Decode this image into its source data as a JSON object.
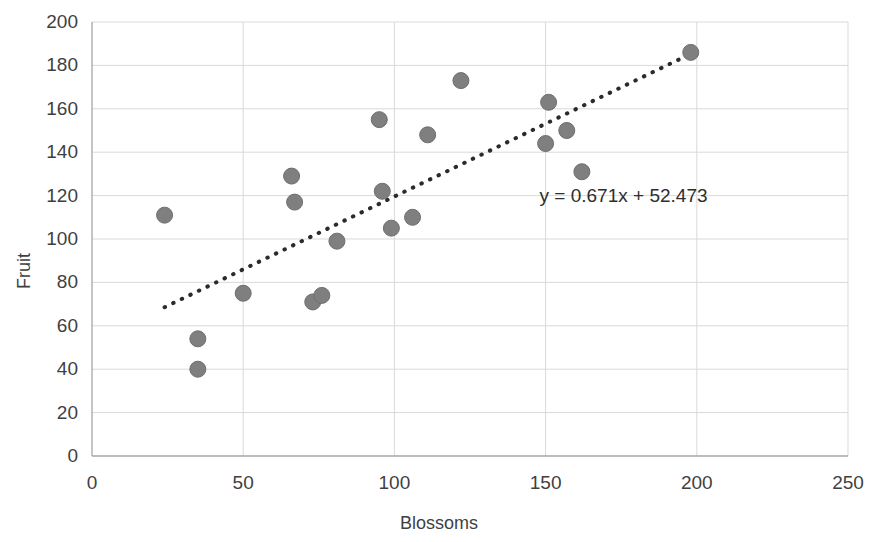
{
  "chart_data": {
    "type": "scatter",
    "title": "",
    "xlabel": "Blossoms",
    "ylabel": "Fruit",
    "xlim": [
      0,
      250
    ],
    "ylim": [
      0,
      200
    ],
    "xticks": [
      0,
      50,
      100,
      150,
      200,
      250
    ],
    "yticks": [
      0,
      20,
      40,
      60,
      80,
      100,
      120,
      140,
      160,
      180,
      200
    ],
    "grid": true,
    "legend": "none",
    "series": [
      {
        "name": "Fruit vs Blossoms",
        "marker": "circle",
        "color": "#7f7f7f",
        "points": [
          {
            "x": 24,
            "y": 111
          },
          {
            "x": 35,
            "y": 54
          },
          {
            "x": 35,
            "y": 40
          },
          {
            "x": 50,
            "y": 75
          },
          {
            "x": 66,
            "y": 129
          },
          {
            "x": 67,
            "y": 117
          },
          {
            "x": 73,
            "y": 71
          },
          {
            "x": 76,
            "y": 74
          },
          {
            "x": 81,
            "y": 99
          },
          {
            "x": 95,
            "y": 155
          },
          {
            "x": 96,
            "y": 122
          },
          {
            "x": 99,
            "y": 105
          },
          {
            "x": 106,
            "y": 110
          },
          {
            "x": 111,
            "y": 148
          },
          {
            "x": 122,
            "y": 173
          },
          {
            "x": 150,
            "y": 144
          },
          {
            "x": 151,
            "y": 163
          },
          {
            "x": 157,
            "y": 150
          },
          {
            "x": 162,
            "y": 131
          },
          {
            "x": 198,
            "y": 186
          }
        ]
      }
    ],
    "trendline": {
      "equation": "y = 0.671x + 52.473",
      "slope": 0.671,
      "intercept": 52.473,
      "style": "dotted",
      "color": "#2b2b2b",
      "x_start": 24,
      "x_end": 198
    },
    "annotations": [
      {
        "name": "trendline-equation",
        "text": "y = 0.671x + 52.473",
        "x": 148,
        "y": 120
      }
    ]
  },
  "axes": {
    "y_title": "Fruit",
    "x_title": "Blossoms",
    "y_tick_labels": [
      "200",
      "180",
      "160",
      "140",
      "120",
      "100",
      "80",
      "60",
      "40",
      "20",
      "0"
    ],
    "x_tick_labels": [
      "0",
      "50",
      "100",
      "150",
      "200",
      "250"
    ]
  },
  "colors": {
    "marker": "#7f7f7f",
    "marker_stroke": "#6e6e6e",
    "trendline": "#2b2b2b",
    "gridline": "#d9d9d9",
    "axis": "#a6a6a6",
    "text": "#3f3f3f",
    "background": "#ffffff"
  }
}
